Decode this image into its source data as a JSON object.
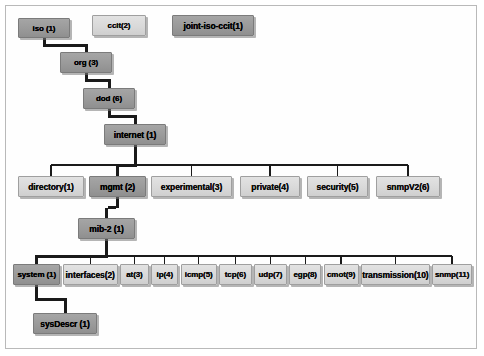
{
  "diagram": {
    "colors": {
      "dark_node": "#9a9a9a",
      "light_node": "#d9d9d9",
      "node_border": "#8e8e8e",
      "connector": "#1a1a1a",
      "frame_border": "#b9b9b9",
      "background": "#ffffff"
    },
    "nodes": [
      {
        "id": "iso",
        "label": "iso (1)",
        "shade": "dark",
        "x": 18,
        "y": 18,
        "w": 52,
        "h": 20
      },
      {
        "id": "ccit",
        "label": "ccit(2)",
        "shade": "light",
        "x": 92,
        "y": 15,
        "w": 54,
        "h": 21
      },
      {
        "id": "joint",
        "label": "joint-iso-ccit(1)",
        "shade": "dark",
        "x": 172,
        "y": 15,
        "w": 82,
        "h": 21
      },
      {
        "id": "org",
        "label": "org (3)",
        "shade": "dark",
        "x": 60,
        "y": 52,
        "w": 52,
        "h": 21
      },
      {
        "id": "dod",
        "label": "dod (6)",
        "shade": "dark",
        "x": 83,
        "y": 88,
        "w": 52,
        "h": 21
      },
      {
        "id": "internet",
        "label": "internet (1)",
        "shade": "dark",
        "x": 104,
        "y": 124,
        "w": 62,
        "h": 21
      },
      {
        "id": "directory",
        "label": "directory(1)",
        "shade": "light",
        "x": 18,
        "y": 176,
        "w": 66,
        "h": 21
      },
      {
        "id": "mgmt",
        "label": "mgmt (2)",
        "shade": "dark",
        "x": 89,
        "y": 176,
        "w": 57,
        "h": 21
      },
      {
        "id": "experimental",
        "label": "experimental(3)",
        "shade": "light",
        "x": 151,
        "y": 176,
        "w": 81,
        "h": 21
      },
      {
        "id": "private",
        "label": "private(4)",
        "shade": "light",
        "x": 240,
        "y": 176,
        "w": 60,
        "h": 21
      },
      {
        "id": "security",
        "label": "security(5)",
        "shade": "light",
        "x": 307,
        "y": 176,
        "w": 61,
        "h": 21
      },
      {
        "id": "snmpV2",
        "label": "snmpV2(6)",
        "shade": "light",
        "x": 376,
        "y": 176,
        "w": 64,
        "h": 21
      },
      {
        "id": "mib2",
        "label": "mib-2 (1)",
        "shade": "dark",
        "x": 78,
        "y": 218,
        "w": 57,
        "h": 21
      },
      {
        "id": "system",
        "label": "system (1)",
        "shade": "dark",
        "x": 14,
        "y": 264,
        "w": 59,
        "h": 21
      },
      {
        "id": "interfaces",
        "label": "interfaces(2)",
        "shade": "light",
        "x": 76,
        "y": 264,
        "w": 69,
        "h": 21
      },
      {
        "id": "at",
        "label": "at(3)",
        "shade": "light",
        "x": 148,
        "y": 264,
        "w": 36,
        "h": 21
      },
      {
        "id": "ip",
        "label": "ip(4)",
        "shade": "light",
        "x": 187,
        "y": 264,
        "w": 34,
        "h": 21
      },
      {
        "id": "icmp",
        "label": "icmp(5)",
        "shade": "light",
        "x": 224,
        "y": 264,
        "w": 45,
        "h": 21
      },
      {
        "id": "tcp",
        "label": "tcp(6)",
        "shade": "light",
        "x": 272,
        "y": 264,
        "w": 41,
        "h": 21
      },
      {
        "id": "udp",
        "label": "udp(7)",
        "shade": "light",
        "x": 316,
        "y": 264,
        "w": 41,
        "h": 21
      },
      {
        "id": "egp",
        "label": "egp(8)",
        "shade": "light",
        "x": 360,
        "y": 264,
        "w": 40,
        "h": 21
      },
      {
        "id": "cmot",
        "label": "cmot(9)",
        "shade": "light",
        "x": 403,
        "y": 264,
        "w": 44,
        "h": 21
      },
      {
        "id": "transmission",
        "label": "transmission(10)",
        "shade": "light",
        "x": 450,
        "y": 264,
        "w": 86,
        "h": 21
      },
      {
        "id": "snmp",
        "label": "snmp(11)",
        "shade": "light",
        "x": 539,
        "y": 264,
        "w": 50,
        "h": 21
      },
      {
        "id": "sysDescr",
        "label": "sysDescr  (1)",
        "shade": "dark",
        "x": 33,
        "y": 313,
        "w": 64,
        "h": 21
      }
    ],
    "edges": [
      {
        "from": "iso",
        "to": "org",
        "type": "chain",
        "weight": "thick"
      },
      {
        "from": "org",
        "to": "dod",
        "type": "chain",
        "weight": "thick"
      },
      {
        "from": "dod",
        "to": "internet",
        "type": "chain",
        "weight": "thick"
      },
      {
        "from": "internet",
        "to": "directory",
        "type": "bus",
        "weight": "thin"
      },
      {
        "from": "internet",
        "to": "mgmt",
        "type": "bus",
        "weight": "thick"
      },
      {
        "from": "internet",
        "to": "experimental",
        "type": "bus",
        "weight": "thin"
      },
      {
        "from": "internet",
        "to": "private",
        "type": "bus",
        "weight": "thin"
      },
      {
        "from": "internet",
        "to": "security",
        "type": "bus",
        "weight": "thin"
      },
      {
        "from": "internet",
        "to": "snmpV2",
        "type": "bus",
        "weight": "thin"
      },
      {
        "from": "mgmt",
        "to": "mib2",
        "type": "chain",
        "weight": "thick"
      },
      {
        "from": "mib2",
        "to": "system",
        "type": "bus",
        "weight": "thick"
      },
      {
        "from": "mib2",
        "to": "interfaces",
        "type": "bus",
        "weight": "thin"
      },
      {
        "from": "mib2",
        "to": "at",
        "type": "bus",
        "weight": "thin"
      },
      {
        "from": "mib2",
        "to": "ip",
        "type": "bus",
        "weight": "thin"
      },
      {
        "from": "mib2",
        "to": "icmp",
        "type": "bus",
        "weight": "thin"
      },
      {
        "from": "mib2",
        "to": "tcp",
        "type": "bus",
        "weight": "thin"
      },
      {
        "from": "mib2",
        "to": "udp",
        "type": "bus",
        "weight": "thin"
      },
      {
        "from": "mib2",
        "to": "egp",
        "type": "bus",
        "weight": "thin"
      },
      {
        "from": "mib2",
        "to": "cmot",
        "type": "bus",
        "weight": "thin"
      },
      {
        "from": "mib2",
        "to": "transmission",
        "type": "bus",
        "weight": "thin"
      },
      {
        "from": "mib2",
        "to": "snmp",
        "type": "bus",
        "weight": "thin"
      },
      {
        "from": "system",
        "to": "sysDescr",
        "type": "chain",
        "weight": "thick"
      }
    ]
  }
}
